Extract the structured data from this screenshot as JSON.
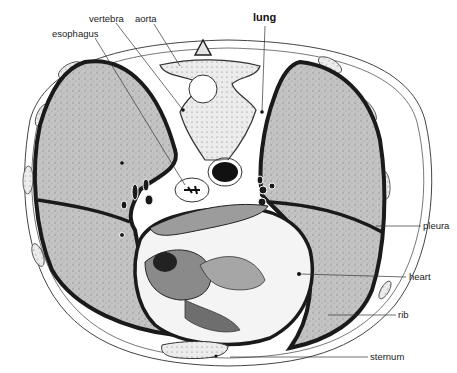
{
  "diagram": {
    "colors": {
      "lung_fill": "#bdbdbd",
      "pleura": "#1a1a1a",
      "heart_fill": "#f4f4f4",
      "bone_fill": "#e6e6e6",
      "line": "#333333",
      "background": "#ffffff"
    },
    "labels": [
      {
        "id": "vertebra",
        "text": "vertebra",
        "x": 89,
        "y": 14,
        "bold": false
      },
      {
        "id": "aorta",
        "text": "aorta",
        "x": 135,
        "y": 14,
        "bold": false
      },
      {
        "id": "esophagus",
        "text": "esophagus",
        "x": 52,
        "y": 29,
        "bold": false
      },
      {
        "id": "lung",
        "text": "lung",
        "x": 253,
        "y": 13,
        "bold": true
      },
      {
        "id": "pleura",
        "text": "pleura",
        "x": 423,
        "y": 223,
        "bold": false
      },
      {
        "id": "heart",
        "text": "heart",
        "x": 410,
        "y": 273,
        "bold": false
      },
      {
        "id": "rib",
        "text": "rib",
        "x": 398,
        "y": 311,
        "bold": false
      },
      {
        "id": "sternum",
        "text": "sternum",
        "x": 370,
        "y": 353,
        "bold": false
      }
    ]
  }
}
